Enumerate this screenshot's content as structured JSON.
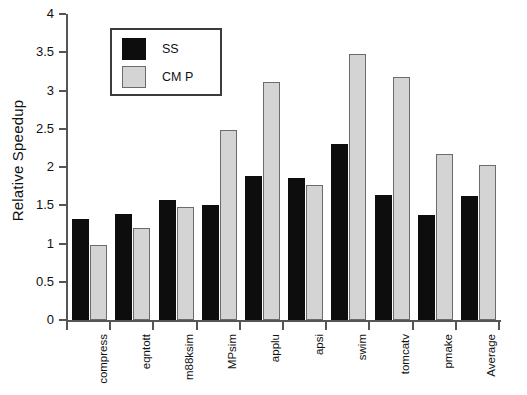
{
  "chart_data": {
    "type": "bar",
    "title": "",
    "xlabel": "",
    "ylabel": "Relative Speedup",
    "ylim": [
      0,
      4
    ],
    "ytick_values": [
      0,
      0.5,
      1,
      1.5,
      2,
      2.5,
      3,
      3.5,
      4
    ],
    "ytick_labels": [
      "0",
      "0.5",
      "1",
      "1.5",
      "2",
      "2.5",
      "3",
      "3.5",
      "4"
    ],
    "grid": false,
    "legend_position": "upper-left-inside",
    "categories": [
      "compress",
      "eqntott",
      "m88ksim",
      "MPsim",
      "applu",
      "apsi",
      "swim",
      "tomcatv",
      "pmake",
      "Average"
    ],
    "series": [
      {
        "name": "SS",
        "color": "#0d0d0d",
        "values": [
          1.32,
          1.39,
          1.57,
          1.5,
          1.88,
          1.86,
          2.3,
          1.63,
          1.37,
          1.62
        ]
      },
      {
        "name": "CM P",
        "color": "#d4d4d4",
        "values": [
          0.98,
          1.2,
          1.48,
          2.48,
          3.11,
          1.77,
          3.48,
          3.18,
          2.17,
          2.03
        ]
      }
    ]
  },
  "legend": {
    "items": [
      {
        "label": "SS",
        "swatch": "ss"
      },
      {
        "label": "CM P",
        "swatch": "cmp"
      }
    ]
  }
}
